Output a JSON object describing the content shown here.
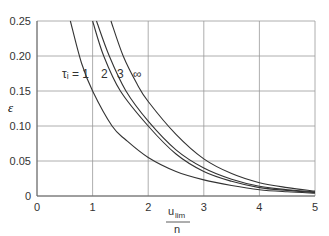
{
  "chart_data": {
    "type": "line",
    "title": "",
    "xlabel": "u_lim / n",
    "xlabel_num": "u",
    "xlabel_sub": "lim",
    "xlabel_den": "n",
    "ylabel": "ε",
    "xlim": [
      0,
      5
    ],
    "ylim": [
      0,
      0.25
    ],
    "grid": true,
    "x_ticks": [
      "0",
      "1",
      "2",
      "3",
      "4",
      "5"
    ],
    "y_ticks": [
      "0",
      "0.05",
      "0.10",
      "0.15",
      "0.20",
      "0.25"
    ],
    "legend_position": "inline labels near curves",
    "series": [
      {
        "name": "τi = 1",
        "label": "τᵢ = 1",
        "x": [
          0.6,
          0.8,
          1.0,
          1.35,
          1.6,
          2.0,
          2.5,
          3.0,
          3.5,
          4.0,
          4.5,
          5.0
        ],
        "y": [
          0.25,
          0.19,
          0.15,
          0.1,
          0.08,
          0.055,
          0.035,
          0.023,
          0.015,
          0.009,
          0.006,
          0.004
        ]
      },
      {
        "name": "τi = 2",
        "label": "2",
        "x": [
          1.0,
          1.2,
          1.5,
          2.0,
          2.5,
          3.0,
          3.5,
          4.0,
          4.5,
          5.0
        ],
        "y": [
          0.25,
          0.2,
          0.15,
          0.1,
          0.06,
          0.035,
          0.021,
          0.012,
          0.008,
          0.005
        ]
      },
      {
        "name": "τi = 3",
        "label": "3",
        "x": [
          1.07,
          1.3,
          1.6,
          2.0,
          2.5,
          3.0,
          3.5,
          4.0,
          4.5,
          5.0
        ],
        "y": [
          0.25,
          0.2,
          0.15,
          0.107,
          0.066,
          0.04,
          0.024,
          0.014,
          0.009,
          0.006
        ]
      },
      {
        "name": "τi = ∞",
        "label": "∞",
        "x": [
          1.33,
          1.55,
          1.8,
          2.0,
          2.5,
          3.0,
          3.5,
          4.0,
          4.5,
          5.0
        ],
        "y": [
          0.25,
          0.2,
          0.16,
          0.135,
          0.088,
          0.053,
          0.032,
          0.019,
          0.012,
          0.007
        ]
      }
    ]
  }
}
